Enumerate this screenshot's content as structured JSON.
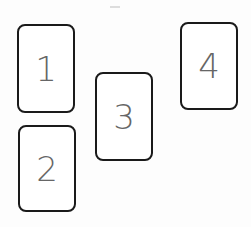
{
  "cards": [
    {
      "label": "1",
      "x": 17,
      "y": 24,
      "w": 58,
      "h": 89
    },
    {
      "label": "2",
      "x": 18,
      "y": 125,
      "w": 58,
      "h": 87
    },
    {
      "label": "3",
      "x": 95,
      "y": 72,
      "w": 58,
      "h": 89
    },
    {
      "label": "4",
      "x": 180,
      "y": 22,
      "w": 58,
      "h": 88
    }
  ]
}
